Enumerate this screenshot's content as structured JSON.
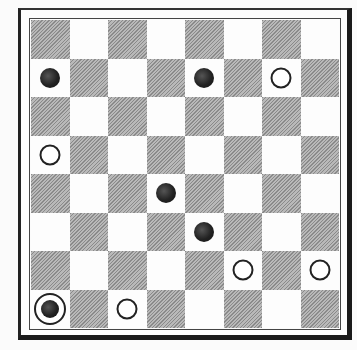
{
  "game": {
    "type": "checkers",
    "board_size": 8,
    "top_left_square": "dark",
    "colors": {
      "dark_square": "#a0a0a0",
      "light_square": "#fdfdfd",
      "black_piece": "#1c1c1c",
      "white_piece": "#ffffff",
      "outline": "#222222"
    },
    "pieces": [
      {
        "row": 1,
        "col": 0,
        "color": "black",
        "king": false
      },
      {
        "row": 1,
        "col": 4,
        "color": "black",
        "king": false
      },
      {
        "row": 1,
        "col": 6,
        "color": "white",
        "king": false
      },
      {
        "row": 3,
        "col": 0,
        "color": "white",
        "king": false
      },
      {
        "row": 4,
        "col": 3,
        "color": "black",
        "king": false
      },
      {
        "row": 5,
        "col": 4,
        "color": "black",
        "king": false
      },
      {
        "row": 6,
        "col": 5,
        "color": "white",
        "king": false
      },
      {
        "row": 6,
        "col": 7,
        "color": "white",
        "king": false
      },
      {
        "row": 7,
        "col": 0,
        "color": "black",
        "king": true
      },
      {
        "row": 7,
        "col": 2,
        "color": "white",
        "king": false
      }
    ]
  }
}
